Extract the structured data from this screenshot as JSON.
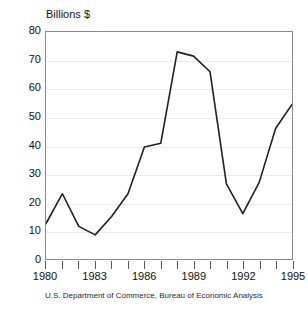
{
  "chart_data": {
    "type": "line",
    "title": "",
    "subtitle": "",
    "ylabel": "Billions $",
    "xlabel": "",
    "ylim": [
      0,
      80
    ],
    "xlim": [
      1980,
      1995
    ],
    "ytick_step": 10,
    "xtick_step": 1,
    "grid": "horizontal",
    "legend": "none",
    "source_note": "U.S. Department of Commerce, Bureau of Economic Analysis",
    "line_color": "#231f20",
    "grid_color": "#ebebeb",
    "frame_color": "#8a8a8a",
    "background_color": "#ffffff",
    "y_ticks": [
      80,
      70,
      60,
      50,
      40,
      30,
      20,
      10,
      0
    ],
    "x_ticks": [
      1980,
      1981,
      1982,
      1983,
      1984,
      1985,
      1986,
      1987,
      1988,
      1989,
      1990,
      1991,
      1992,
      1993,
      1994,
      1995
    ],
    "x_tick_labels": [
      "1980",
      "",
      "",
      "1983",
      "",
      "",
      "1986",
      "",
      "",
      "1989",
      "",
      "",
      "1992",
      "",
      "",
      "1995"
    ],
    "x_labeled_ticks": [
      "1980",
      "1983",
      "1986",
      "1989",
      "1992",
      "1995"
    ],
    "x": [
      1980,
      1981,
      1982,
      1983,
      1984,
      1985,
      1986,
      1987,
      1988,
      1989,
      1990,
      1991,
      1992,
      1993,
      1994,
      1995
    ],
    "values": [
      12.5,
      23,
      11.5,
      8.5,
      15,
      23,
      39.5,
      40.8,
      73,
      71.5,
      66,
      26.5,
      16,
      27,
      46,
      54.5
    ],
    "series": [
      {
        "name": "Billions $",
        "values": [
          12.5,
          23,
          11.5,
          8.5,
          15,
          23,
          39.5,
          40.8,
          73,
          71.5,
          66,
          26.5,
          16,
          27,
          46,
          54.5
        ]
      }
    ]
  }
}
